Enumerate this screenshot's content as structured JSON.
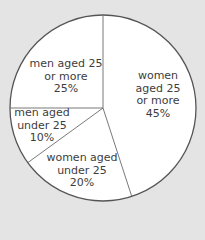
{
  "chart_data": {
    "type": "pie",
    "title": "",
    "start_angle_deg": 0,
    "direction": "clockwise",
    "colors": {
      "background": "#e4e4e4",
      "slice_fill": "#ffffff",
      "stroke": "#555555",
      "text": "#3d3d3d"
    },
    "slices": [
      {
        "label": "women aged 25 or more",
        "value": 45,
        "lines": [
          "women",
          "aged 25",
          "or more",
          "45%"
        ],
        "label_pos": [
          158,
          95
        ]
      },
      {
        "label": "women aged under 25",
        "value": 20,
        "lines": [
          "women aged",
          "under 25",
          "20%"
        ],
        "label_pos": [
          82,
          171
        ]
      },
      {
        "label": "men aged under 25",
        "value": 10,
        "lines": [
          "men aged",
          "under 25",
          "10%"
        ],
        "label_pos": [
          42,
          126
        ]
      },
      {
        "label": "men aged 25 or more",
        "value": 25,
        "lines": [
          "men aged 25",
          "or more",
          "25%"
        ],
        "label_pos": [
          66,
          77
        ]
      }
    ]
  }
}
